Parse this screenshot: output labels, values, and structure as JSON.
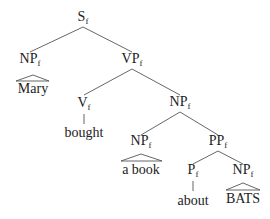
{
  "tree": {
    "subscript": "f",
    "nodes": {
      "s": {
        "label": "S"
      },
      "np_subj": {
        "label": "NP"
      },
      "vp": {
        "label": "VP"
      },
      "v": {
        "label": "V"
      },
      "np_obj": {
        "label": "NP"
      },
      "np_book": {
        "label": "NP"
      },
      "pp": {
        "label": "PP"
      },
      "p": {
        "label": "P"
      },
      "np_bats": {
        "label": "NP"
      }
    },
    "leaves": {
      "mary": "Mary",
      "bought": "bought",
      "a_book": "a book",
      "about": "about",
      "bats": "BATS"
    }
  }
}
